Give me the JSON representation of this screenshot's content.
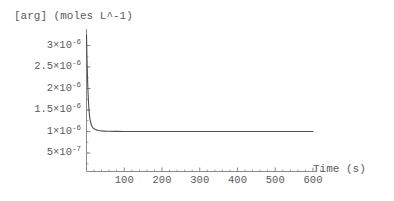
{
  "chart_data": {
    "type": "line",
    "title": "",
    "ylabel": "[arg] (moles L^-1)",
    "xlabel": "Time (s)",
    "xlim": [
      0,
      640
    ],
    "ylim": [
      0,
      3.25e-06
    ],
    "grid": false,
    "legend": null,
    "x_ticks": [
      100,
      200,
      300,
      400,
      500,
      600
    ],
    "x_tick_labels": [
      "100",
      "200",
      "300",
      "400",
      "500",
      "600"
    ],
    "y_ticks": [
      5e-07,
      1e-06,
      1.5e-06,
      2e-06,
      2.5e-06,
      3e-06
    ],
    "y_tick_labels": [
      {
        "mantissa": "5×10",
        "exp": "-7"
      },
      {
        "mantissa": "1×10",
        "exp": "-6"
      },
      {
        "mantissa": "1.5×10",
        "exp": "-6"
      },
      {
        "mantissa": "2×10",
        "exp": "-6"
      },
      {
        "mantissa": "2.5×10",
        "exp": "-6"
      },
      {
        "mantissa": "3×10",
        "exp": "-6"
      }
    ],
    "series": [
      {
        "name": "[arg]",
        "color": "#4d4d4d",
        "description": "Sharp exponential decay from high initial concentration to a steady-state plateau at 1×10^-6 moles L^-1",
        "x": [
          0,
          1,
          2,
          3,
          4,
          5,
          6,
          7,
          8,
          9,
          10,
          12,
          14,
          16,
          18,
          20,
          24,
          28,
          32,
          36,
          40,
          50,
          60,
          80,
          100,
          150,
          200,
          250,
          300,
          350,
          400,
          450,
          500,
          550,
          600
        ],
        "y": [
          3.25e-06,
          2.82e-06,
          2.46e-06,
          2.16e-06,
          1.92e-06,
          1.73e-06,
          1.58e-06,
          1.46e-06,
          1.37e-06,
          1.3e-06,
          1.25e-06,
          1.18e-06,
          1.13e-06,
          1.1e-06,
          1.08e-06,
          1.065e-06,
          1.045e-06,
          1.032e-06,
          1.024e-06,
          1.018e-06,
          1.014e-06,
          1.008e-06,
          1.005e-06,
          1.002e-06,
          1.001e-06,
          1e-06,
          1e-06,
          1e-06,
          1e-06,
          1e-06,
          1e-06,
          1e-06,
          1e-06,
          1e-06,
          1e-06
        ]
      }
    ],
    "plateau_value": 1e-06,
    "axis_color": "#808080",
    "background": "#ffffff"
  }
}
